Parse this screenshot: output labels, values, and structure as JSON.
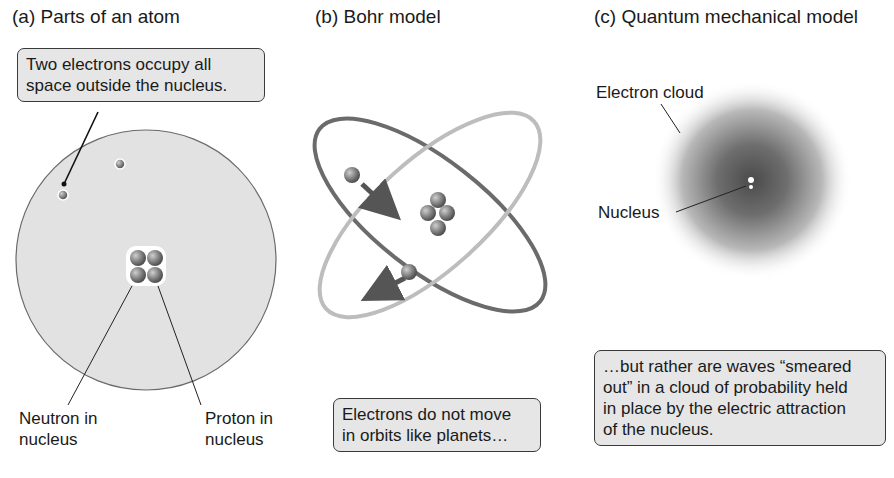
{
  "panels": [
    {
      "id": "a",
      "title": "(a)  Parts of an atom",
      "callout": "Two electrons occupy all space outside the nucleus.",
      "callout_lines": [
        "Two electrons occupy all",
        "space outside the nucleus."
      ],
      "labels": {
        "neutron": [
          "Neutron in",
          "nucleus"
        ],
        "proton": [
          "Proton in",
          "nucleus"
        ]
      }
    },
    {
      "id": "b",
      "title": "(b)  Bohr model",
      "callout_lines": [
        "Electrons do not move",
        "in orbits like planets…"
      ]
    },
    {
      "id": "c",
      "title": "(c)  Quantum mechanical model",
      "labels": {
        "cloud": "Electron cloud",
        "nucleus": "Nucleus"
      },
      "callout_lines": [
        "…but rather are waves “smeared",
        "out” in a cloud of probability held",
        "in place by the electric attraction",
        "of the nucleus."
      ]
    }
  ],
  "colors": {
    "callout_bg": "#e6e6e6",
    "atom_fill": "#e2e2e2",
    "orbit": "#5a5a5a",
    "particle": "#7a7a7a"
  }
}
